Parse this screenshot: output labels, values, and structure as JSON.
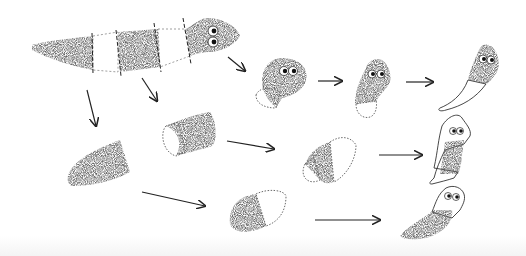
{
  "diagram": {
    "colors": {
      "background": "#ffffff",
      "tissue_stipple": "#2a2a2a",
      "outline": "#333333",
      "arrow": "#222222",
      "new_tissue": "#ffffff"
    },
    "parts": {
      "whole_worm": {
        "segments": 5,
        "cut_lines": 4,
        "eyes": 2
      },
      "head_fragment": {
        "stages": 3
      },
      "middle_fragment": {
        "stages": 3
      },
      "trunk_fragment": {
        "stages": 3
      },
      "tail_fragment": {
        "stages": 3
      }
    },
    "arrows": 10
  }
}
